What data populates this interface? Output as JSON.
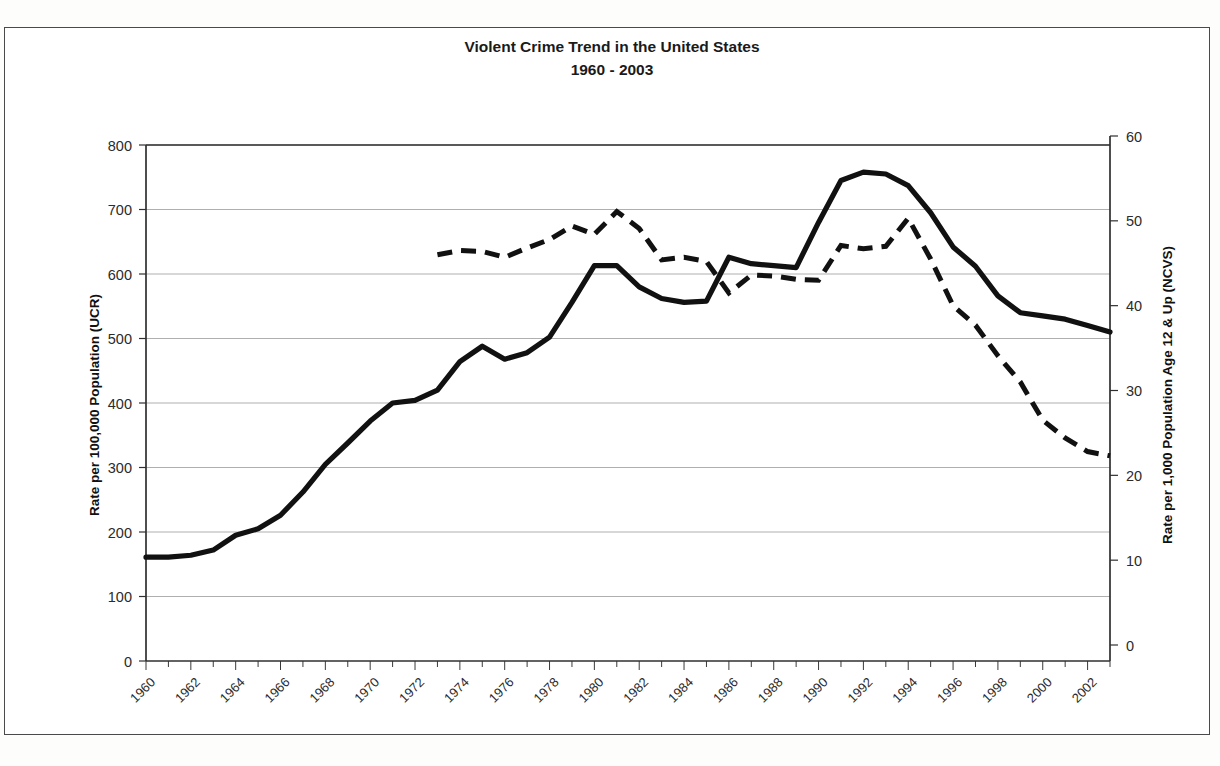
{
  "chart_data": {
    "type": "line",
    "title": "Violent Crime Trend in the United States",
    "subtitle": "1960 - 2003",
    "xlabel": "",
    "ylabel": "Rate per 100,000 Population (UCR)",
    "y2label": "Rate per 1,000 Population Age 12 & Up (NCVS)",
    "ylim": [
      0,
      800
    ],
    "y2lim": [
      0,
      60
    ],
    "xlim": [
      1960,
      2003
    ],
    "yticks": [
      0,
      100,
      200,
      300,
      400,
      500,
      600,
      700,
      800
    ],
    "y2ticks": [
      0,
      10,
      20,
      30,
      40,
      50,
      60
    ],
    "xticks": [
      1960,
      1962,
      1964,
      1966,
      1968,
      1970,
      1972,
      1974,
      1976,
      1978,
      1980,
      1982,
      1984,
      1986,
      1988,
      1990,
      1992,
      1994,
      1996,
      1998,
      2000,
      2002
    ],
    "grid": "horizontal",
    "legend": "none",
    "x": [
      1960,
      1961,
      1962,
      1963,
      1964,
      1965,
      1966,
      1967,
      1968,
      1969,
      1970,
      1971,
      1972,
      1973,
      1974,
      1975,
      1976,
      1977,
      1978,
      1979,
      1980,
      1981,
      1982,
      1983,
      1984,
      1985,
      1986,
      1987,
      1988,
      1989,
      1990,
      1991,
      1992,
      1993,
      1994,
      1995,
      1996,
      1997,
      1998,
      1999,
      2000,
      2001,
      2002,
      2003
    ],
    "series": [
      {
        "name": "Rate per 100,000 Population (UCR)",
        "axis": "left",
        "style": "solid",
        "color": "#111111",
        "x": [
          1960,
          1961,
          1962,
          1963,
          1964,
          1965,
          1966,
          1967,
          1968,
          1969,
          1970,
          1971,
          1972,
          1973,
          1974,
          1975,
          1976,
          1977,
          1978,
          1979,
          1980,
          1981,
          1982,
          1983,
          1984,
          1985,
          1986,
          1987,
          1988,
          1989,
          1990,
          1991,
          1992,
          1993,
          1994,
          1995,
          1996,
          1997,
          1998,
          1999,
          2000,
          2001,
          2002,
          2003
        ],
        "values": [
          161,
          159,
          162,
          168,
          191,
          200,
          220,
          254,
          298,
          329,
          364,
          396,
          401,
          417,
          461,
          488,
          468,
          476,
          498,
          549,
          597,
          594,
          571,
          538,
          539,
          557,
          620,
          610,
          637,
          663,
          732,
          758,
          758,
          747,
          714,
          685,
          637,
          611,
          567,
          523,
          507,
          504,
          495,
          476
        ],
        "plot_values": [
          161,
          161,
          164,
          172,
          195,
          205,
          226,
          262,
          305,
          338,
          372,
          400,
          404,
          420,
          464,
          488,
          468,
          478,
          502,
          556,
          613,
          613,
          580,
          562,
          556,
          558,
          626,
          616,
          613,
          610,
          680,
          745,
          758,
          755,
          737,
          695,
          642,
          612,
          566,
          540,
          535,
          530,
          520,
          510
        ]
      },
      {
        "name": "Rate per 1,000 Population Age 12 & Up (NCVS)",
        "axis": "right",
        "style": "dashed",
        "color": "#111111",
        "x": [
          1973,
          1974,
          1975,
          1976,
          1977,
          1978,
          1979,
          1980,
          1981,
          1982,
          1983,
          1984,
          1985,
          1986,
          1987,
          1988,
          1989,
          1990,
          1991,
          1992,
          1993,
          1994,
          1995,
          1996,
          1997,
          1998,
          1999,
          2000,
          2001,
          2002,
          2003
        ],
        "values": [
          46.0,
          46.5,
          46.4,
          45.7,
          46.8,
          47.8,
          49.4,
          48.4,
          51.1,
          49.1,
          45.4,
          45.7,
          45.2,
          41.5,
          43.6,
          43.5,
          43.1,
          43.0,
          47.1,
          46.7,
          47.0,
          50.3,
          45.5,
          40.0,
          37.7,
          34.1,
          31.0,
          26.5,
          24.4,
          22.8,
          22.3
        ]
      }
    ]
  },
  "axes": {
    "left_title": "Rate per 100,000 Population (UCR)",
    "right_title": "Rate per 1,000 Population Age 12 & Up (NCVS)",
    "left_ticks": [
      "800",
      "700",
      "600",
      "500",
      "400",
      "300",
      "200",
      "100",
      "0"
    ],
    "right_ticks": [
      "60",
      "50",
      "40",
      "30",
      "20",
      "10",
      "0"
    ],
    "x_ticks": [
      "1960",
      "1962",
      "1964",
      "1966",
      "1968",
      "1970",
      "1972",
      "1974",
      "1976",
      "1978",
      "1980",
      "1982",
      "1984",
      "1986",
      "1988",
      "1990",
      "1992",
      "1994",
      "1996",
      "1998",
      "2000",
      "2002"
    ]
  },
  "header": {
    "title_line1": "Violent Crime Trend in the United States",
    "title_line2": "1960 - 2003"
  }
}
